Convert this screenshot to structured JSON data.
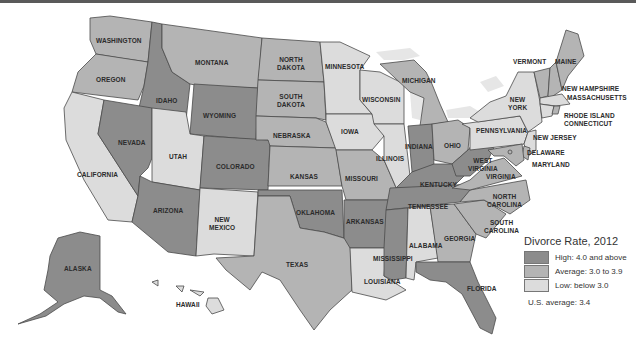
{
  "title": "Divorce Rate, 2012",
  "legend": {
    "title": "Divorce Rate, 2012",
    "items": [
      {
        "key": "high",
        "label": "High: 4.0 and above",
        "color": "#8c8c8c"
      },
      {
        "key": "avg",
        "label": "Average: 3.0 to 3.9",
        "color": "#b4b4b4"
      },
      {
        "key": "low",
        "label": "Low: below 3.0",
        "color": "#dcdcdc"
      }
    ],
    "us_average": "U.S. average: 3.4"
  },
  "states": {
    "washington": {
      "label": "WASHINGTON",
      "category": "avg"
    },
    "oregon": {
      "label": "OREGON",
      "category": "avg"
    },
    "california": {
      "label": "CALIFORNIA",
      "category": "low"
    },
    "idaho": {
      "label": "IDAHO",
      "category": "high"
    },
    "nevada": {
      "label": "NEVADA",
      "category": "high"
    },
    "montana": {
      "label": "MONTANA",
      "category": "avg"
    },
    "wyoming": {
      "label": "WYOMING",
      "category": "high"
    },
    "utah": {
      "label": "UTAH",
      "category": "low"
    },
    "colorado": {
      "label": "COLORADO",
      "category": "high"
    },
    "arizona": {
      "label": "ARIZONA",
      "category": "high"
    },
    "new_mexico": {
      "label": "NEW MEXICO",
      "category": "low"
    },
    "north_dakota": {
      "label": "NORTH DAKOTA",
      "category": "avg"
    },
    "south_dakota": {
      "label": "SOUTH DAKOTA",
      "category": "avg"
    },
    "nebraska": {
      "label": "NEBRASKA",
      "category": "avg"
    },
    "kansas": {
      "label": "KANSAS",
      "category": "avg"
    },
    "oklahoma": {
      "label": "OKLAHOMA",
      "category": "high"
    },
    "texas": {
      "label": "TEXAS",
      "category": "avg"
    },
    "minnesota": {
      "label": "MINNESOTA",
      "category": "low"
    },
    "iowa": {
      "label": "IOWA",
      "category": "low"
    },
    "missouri": {
      "label": "MISSOURI",
      "category": "avg"
    },
    "arkansas": {
      "label": "ARKANSAS",
      "category": "high"
    },
    "louisiana": {
      "label": "LOUISIANA",
      "category": "low"
    },
    "wisconsin": {
      "label": "WISCONSIN",
      "category": "low"
    },
    "illinois": {
      "label": "ILLINOIS",
      "category": "low"
    },
    "michigan": {
      "label": "MICHIGAN",
      "category": "avg"
    },
    "indiana": {
      "label": "INDIANA",
      "category": "high"
    },
    "ohio": {
      "label": "OHIO",
      "category": "avg"
    },
    "kentucky": {
      "label": "KENTUCKY",
      "category": "high"
    },
    "tennessee": {
      "label": "TENNESSEE",
      "category": "high"
    },
    "mississippi": {
      "label": "MISSISSIPPI",
      "category": "high"
    },
    "alabama": {
      "label": "ALABAMA",
      "category": "low"
    },
    "georgia": {
      "label": "GEORGIA",
      "category": "avg"
    },
    "florida": {
      "label": "FLORIDA",
      "category": "high"
    },
    "south_carolina": {
      "label": "SOUTH CAROLINA",
      "category": "avg"
    },
    "north_carolina": {
      "label": "NORTH CAROLINA",
      "category": "avg"
    },
    "virginia": {
      "label": "VIRGINIA",
      "category": "avg"
    },
    "west_virginia": {
      "label": "WEST VIRGINIA",
      "category": "high"
    },
    "pennsylvania": {
      "label": "PENNSYLVANIA",
      "category": "low"
    },
    "new_york": {
      "label": "NEW YORK",
      "category": "low"
    },
    "vermont": {
      "label": "VERMONT",
      "category": "avg"
    },
    "new_hampshire": {
      "label": "NEW HAMPSHIRE",
      "category": "avg"
    },
    "maine": {
      "label": "MAINE",
      "category": "avg"
    },
    "massachusetts": {
      "label": "MASSACHUSETTS",
      "category": "low"
    },
    "rhode_island": {
      "label": "RHODE ISLAND",
      "category": "avg"
    },
    "connecticut": {
      "label": "CONNECTICUT",
      "category": "low"
    },
    "new_jersey": {
      "label": "NEW JERSEY",
      "category": "low"
    },
    "delaware": {
      "label": "DELAWARE",
      "category": "avg"
    },
    "maryland": {
      "label": "MARYLAND",
      "category": "avg"
    },
    "dc": {
      "label": "D.C.",
      "category": "avg"
    },
    "alaska": {
      "label": "ALASKA",
      "category": "high"
    },
    "hawaii": {
      "label": "HAWAII",
      "category": "low"
    }
  },
  "label_lines": {
    "new_mexico": [
      "NEW",
      "MEXICO"
    ],
    "north_dakota": [
      "NORTH",
      "DAKOTA"
    ],
    "south_dakota": [
      "SOUTH",
      "DAKOTA"
    ],
    "new_york": [
      "NEW",
      "YORK"
    ],
    "west_virginia": [
      "WEST",
      "VIRGINIA"
    ],
    "north_carolina": [
      "NORTH",
      "CAROLINA"
    ],
    "south_carolina": [
      "SOUTH",
      "CAROLINA"
    ]
  }
}
